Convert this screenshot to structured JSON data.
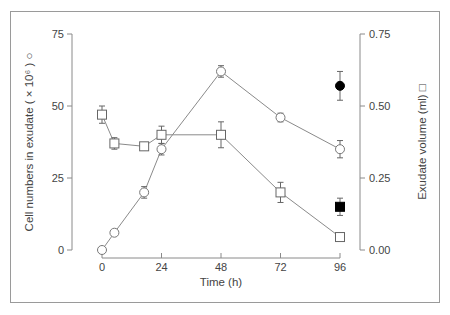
{
  "chart_data": {
    "type": "line",
    "xlabel": "Time (h)",
    "ylabel": "Cell numbers in exudate ( × 10⁶ ) ○",
    "y2label": "Exudate volume (ml) □",
    "x_ticks": [
      0,
      24,
      48,
      72,
      96
    ],
    "y_ticks": [
      0,
      25,
      50,
      75
    ],
    "y2_ticks": [
      "0.00",
      "0.25",
      "0.50",
      "0.75"
    ],
    "xlim": [
      0,
      96
    ],
    "ylim": [
      0,
      75
    ],
    "y2lim": [
      0,
      0.75
    ],
    "grid": false,
    "series": [
      {
        "name": "Cell numbers in exudate (×10⁶)",
        "axis": "left",
        "marker": "open-circle",
        "x": [
          0,
          5,
          17,
          24,
          48,
          72,
          96
        ],
        "y": [
          0,
          6,
          20,
          35,
          62,
          46,
          35
        ],
        "err": [
          0,
          0,
          2,
          2,
          2,
          1.5,
          3
        ]
      },
      {
        "name": "Exudate volume (ml)",
        "axis": "right",
        "marker": "open-square",
        "x": [
          0,
          5,
          17,
          24,
          48,
          72,
          96
        ],
        "y": [
          0.47,
          0.37,
          0.36,
          0.4,
          0.4,
          0.2,
          0.045
        ],
        "err": [
          0.03,
          0.02,
          0.01,
          0.03,
          0.045,
          0.035,
          0.01
        ]
      },
      {
        "name": "Cell numbers (filled)",
        "axis": "left",
        "marker": "filled-circle",
        "x": [
          96
        ],
        "y": [
          57
        ],
        "err": [
          5
        ]
      },
      {
        "name": "Exudate volume (filled)",
        "axis": "right",
        "marker": "filled-square",
        "x": [
          96
        ],
        "y": [
          0.15
        ],
        "err": [
          0.03
        ]
      }
    ]
  }
}
